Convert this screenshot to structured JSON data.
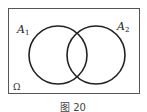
{
  "diagram": {
    "type": "venn",
    "sets": [
      {
        "name": "A1",
        "label": "A",
        "subscript": "1"
      },
      {
        "name": "A2",
        "label": "A",
        "subscript": "2"
      }
    ],
    "universe_label": "Ω",
    "caption": "图 20",
    "colors": {
      "stroke": "#222222",
      "frame": "#444444",
      "background": "#ffffff"
    }
  }
}
